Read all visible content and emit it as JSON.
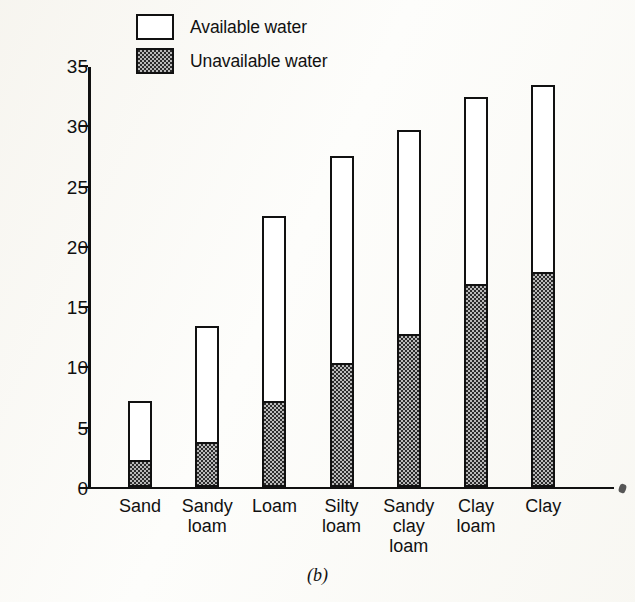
{
  "figure": {
    "caption": "(b)",
    "background_color": "#fdfdfb",
    "ink_color": "#111111",
    "stipple_fill": "#b9b9b9"
  },
  "legend": {
    "position": "top-center",
    "items": [
      {
        "label": "Available water",
        "swatch": "white-box",
        "icon": "legend-swatch-icon"
      },
      {
        "label": "Unavailable water",
        "swatch": "stippled-box",
        "icon": "legend-swatch-icon"
      }
    ]
  },
  "axes": {
    "y_title": "Water content (per cent)",
    "y_ticks": [
      "0",
      "5",
      "10",
      "15",
      "20",
      "25",
      "30",
      "35"
    ],
    "y_min": 0,
    "y_max": 35
  },
  "chart_data": {
    "type": "bar",
    "title": "",
    "subtitle": "",
    "xlabel": "",
    "ylabel": "Water content (per cent)",
    "ylim": [
      0,
      35
    ],
    "yticks": [
      0,
      5,
      10,
      15,
      20,
      25,
      30,
      35
    ],
    "grid": false,
    "stacked": true,
    "legend_position": "top-center",
    "annotations": [
      "(b)"
    ],
    "categories": [
      "Sand",
      "Sandy\nloam",
      "Loam",
      "Silty\nloam",
      "Sandy\nclay\nloam",
      "Clay\nloam",
      "Clay"
    ],
    "series": [
      {
        "name": "Unavailable water",
        "values": [
          2.0,
          3.5,
          6.9,
          10.1,
          12.5,
          16.6,
          17.6
        ]
      },
      {
        "name": "Available water",
        "values": [
          4.9,
          9.6,
          15.3,
          17.1,
          16.9,
          15.5,
          15.5
        ]
      }
    ],
    "totals": [
      6.9,
      13.1,
      22.2,
      27.2,
      29.4,
      32.1,
      33.1
    ]
  }
}
